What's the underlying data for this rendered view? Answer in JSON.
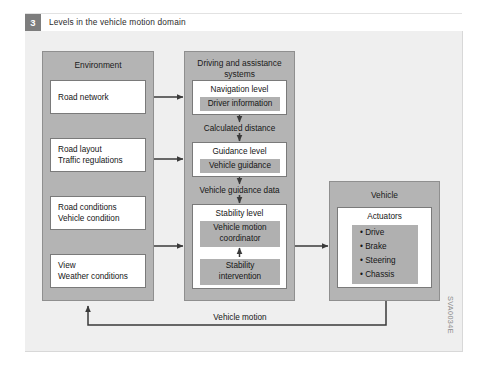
{
  "figure": {
    "number": "3",
    "title": "Levels in the vehicle motion domain",
    "side_code": "SVA0034E"
  },
  "environment": {
    "title": "Environment",
    "items": [
      {
        "line1": "Road network",
        "line2": ""
      },
      {
        "line1": "Road layout",
        "line2": "Traffic regulations"
      },
      {
        "line1": "Road conditions",
        "line2": "Vehicle condition"
      },
      {
        "line1": "View",
        "line2": "Weather conditions"
      }
    ]
  },
  "driving": {
    "title_line1": "Driving and assistance",
    "title_line2": "systems",
    "navigation": {
      "title": "Navigation level",
      "inner": "Driver information"
    },
    "guidance": {
      "title": "Guidance level",
      "inner": "Vehicle guidance"
    },
    "stability": {
      "title": "Stability level",
      "coordinator_line1": "Vehicle motion",
      "coordinator_line2": "coordinator",
      "intervention_line1": "Stability",
      "intervention_line2": "intervention"
    }
  },
  "vehicle": {
    "title": "Vehicle",
    "actuators_title": "Actuators",
    "actuators": [
      "• Drive",
      "• Brake",
      "• Steering",
      "• Chassis"
    ]
  },
  "connections": {
    "calculated_distance": "Calculated distance",
    "vehicle_guidance_data": "Vehicle guidance data",
    "vehicle_motion": "Vehicle motion"
  },
  "colors": {
    "panel_bg": "#efefef",
    "group_grey": "#b4b4b4",
    "inner_grey": "#b0b0b0",
    "badge_grey": "#7d7d7d",
    "line": "#3a3a3a"
  }
}
